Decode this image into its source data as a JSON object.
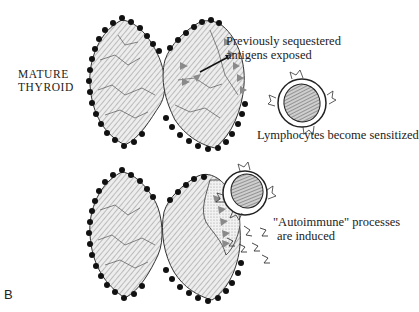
{
  "figure": {
    "panel_label": "B",
    "colors": {
      "background": "#ffffff",
      "ink": "#1a1a1a",
      "lobe_fill": "#e6e6e6",
      "lobe_hatch": "#7a7a7a",
      "antigen": "#8a8a8a",
      "lymphocyte_nucleus": "#9a9a9a"
    },
    "stage_1": {
      "label_line1": "MATURE",
      "label_line2": "THYROID",
      "antigen_note_line1": "Previously sequestered",
      "antigen_note_line2": "antigens exposed",
      "lymphocyte_note": "Lymphocytes become sensitized",
      "icons": [
        "thyroid-gland-icon",
        "antigen-triangle-icon",
        "lymphocyte-icon"
      ]
    },
    "stage_2": {
      "process_note_line1": "\"Autoimmune\" processes",
      "process_note_line2": "are induced",
      "icons": [
        "thyroid-gland-icon",
        "lymphocyte-icon",
        "antibody-fragment-icon"
      ]
    }
  }
}
